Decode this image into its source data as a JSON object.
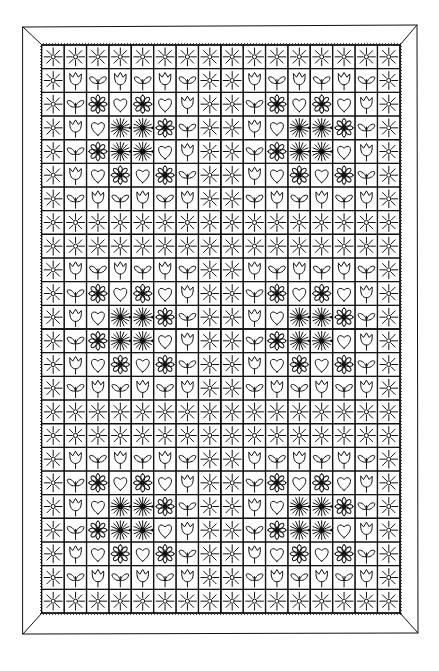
{
  "image": {
    "subject": "Black-and-white line drawing of a log-cabin style quilt",
    "description": "Hand-drawn quilt made of strips of repeating motifs (starbursts, daisies, hearts, tulips, leaves, suns) arranged in quarter log-cabin blocks, surrounded by a plain mitered border with a stitched inner edge.",
    "ink_color": "#111111",
    "paper_color": "#ffffff"
  },
  "quilt": {
    "border": "plain mitered frame",
    "block_grid": {
      "columns": 4,
      "rows": 6
    },
    "motif_types": [
      "starburst",
      "daisy",
      "heart",
      "tulip",
      "leaf",
      "sun"
    ],
    "ring_order_from_corner": [
      "starburst",
      "daisy-heart",
      "tulip-leaf",
      "sun"
    ],
    "blocks": [
      [
        "br",
        "bl",
        "br",
        "bl"
      ],
      [
        "tr",
        "tl",
        "tr",
        "tl"
      ],
      [
        "br",
        "bl",
        "br",
        "bl"
      ],
      [
        "tr",
        "tl",
        "tr",
        "tl"
      ],
      [
        "br",
        "bl",
        "br",
        "bl"
      ],
      [
        "tr",
        "tl",
        "tr",
        "tl"
      ]
    ]
  }
}
